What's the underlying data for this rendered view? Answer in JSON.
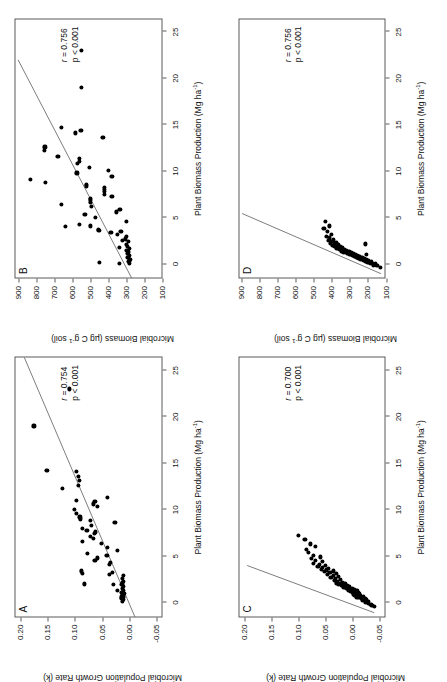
{
  "figure": {
    "panels": [
      {
        "id": "A",
        "letter": "A",
        "stats": {
          "r_label": "r",
          "r_value": "= 0.754",
          "p_value": "p < 0.001"
        },
        "xlabel": "Plant Biomass Production (Mg ha-1)",
        "ylabel": "Microbial Population Growth Rate (k)",
        "xticks": [
          0,
          5,
          10,
          15,
          20,
          25
        ],
        "yticks": [
          "-0.05",
          "0.00",
          "0.05",
          "0.10",
          "0.15",
          "0.20"
        ],
        "xlim": [
          -1.6,
          26.5
        ],
        "ylim": [
          -0.062,
          0.212
        ],
        "fit": {
          "x1": -1.6,
          "y1": -0.012,
          "x2": 26.5,
          "y2": 0.194
        },
        "points": [
          [
            0.1,
            0.012
          ],
          [
            0.3,
            0.01
          ],
          [
            0.4,
            0.014
          ],
          [
            0.5,
            0.011
          ],
          [
            0.6,
            0.013
          ],
          [
            0.7,
            0.01
          ],
          [
            0.9,
            0.012
          ],
          [
            1.0,
            0.009
          ],
          [
            1.1,
            0.013
          ],
          [
            1.3,
            0.011
          ],
          [
            1.5,
            0.012
          ],
          [
            1.7,
            0.01
          ],
          [
            1.9,
            0.013
          ],
          [
            2.1,
            0.012
          ],
          [
            2.3,
            0.011
          ],
          [
            2.6,
            0.012
          ],
          [
            2.9,
            0.01
          ],
          [
            1.3,
            0.022
          ],
          [
            1.9,
            0.029
          ],
          [
            2.0,
            0.082
          ],
          [
            3.0,
            0.036
          ],
          [
            3.1,
            0.086
          ],
          [
            3.2,
            0.03
          ],
          [
            3.4,
            0.088
          ],
          [
            4.1,
            0.036
          ],
          [
            4.3,
            0.035
          ],
          [
            4.5,
            0.063
          ],
          [
            4.8,
            0.058
          ],
          [
            5.1,
            0.041
          ],
          [
            5.3,
            0.077
          ],
          [
            5.6,
            0.021
          ],
          [
            5.9,
            0.04
          ],
          [
            6.4,
            0.051
          ],
          [
            6.6,
            0.086
          ],
          [
            6.9,
            0.066
          ],
          [
            7.1,
            0.072
          ],
          [
            7.4,
            0.064
          ],
          [
            7.6,
            0.062
          ],
          [
            7.8,
            0.078
          ],
          [
            8.0,
            0.087
          ],
          [
            8.3,
            0.069
          ],
          [
            8.6,
            0.026
          ],
          [
            8.8,
            0.072
          ],
          [
            9.0,
            0.09
          ],
          [
            9.2,
            0.091
          ],
          [
            9.6,
            0.097
          ],
          [
            10.0,
            0.101
          ],
          [
            10.3,
            0.058
          ],
          [
            10.6,
            0.066
          ],
          [
            10.9,
            0.063
          ],
          [
            11.0,
            0.097
          ],
          [
            11.3,
            0.04
          ],
          [
            12.3,
            0.124
          ],
          [
            12.6,
            0.094
          ],
          [
            13.1,
            0.092
          ],
          [
            13.6,
            0.093
          ],
          [
            14.1,
            0.097
          ],
          [
            14.2,
            0.152
          ],
          [
            19.0,
            0.176
          ],
          [
            23.0,
            0.11
          ]
        ]
      },
      {
        "id": "B",
        "letter": "B",
        "stats": {
          "r_label": "r",
          "r_value": "= 0.756",
          "p_value": "p < 0.001"
        },
        "xlabel": "Plant Biomass Production (Mg ha-1)",
        "ylabel": "Microbial Biomass (ug C g-1 soil)",
        "xticks": [
          0,
          5,
          10,
          15,
          20,
          25
        ],
        "yticks": [
          100,
          200,
          300,
          400,
          500,
          600,
          700,
          800,
          900
        ],
        "xlim": [
          -1.6,
          26.5
        ],
        "ylim": [
          100,
          920
        ],
        "fit": {
          "x1": -1.6,
          "y1": 268,
          "x2": 22.0,
          "y2": 900
        },
        "points": [
          [
            0.1,
            282
          ],
          [
            0.3,
            286
          ],
          [
            0.5,
            281
          ],
          [
            0.7,
            292
          ],
          [
            0.9,
            284
          ],
          [
            1.1,
            296
          ],
          [
            1.3,
            288
          ],
          [
            1.5,
            300
          ],
          [
            1.7,
            285
          ],
          [
            1.9,
            293
          ],
          [
            2.1,
            300
          ],
          [
            2.4,
            287
          ],
          [
            2.7,
            306
          ],
          [
            0.1,
            340
          ],
          [
            1.8,
            338
          ],
          [
            2.5,
            320
          ],
          [
            0.2,
            448
          ],
          [
            3.0,
            300
          ],
          [
            3.2,
            352
          ],
          [
            3.4,
            386
          ],
          [
            3.5,
            330
          ],
          [
            3.6,
            452
          ],
          [
            3.7,
            456
          ],
          [
            4.0,
            640
          ],
          [
            4.1,
            498
          ],
          [
            4.3,
            560
          ],
          [
            4.6,
            300
          ],
          [
            5.0,
            472
          ],
          [
            5.3,
            530
          ],
          [
            5.6,
            356
          ],
          [
            5.9,
            336
          ],
          [
            6.2,
            492
          ],
          [
            6.4,
            660
          ],
          [
            6.6,
            500
          ],
          [
            6.9,
            498
          ],
          [
            7.1,
            500
          ],
          [
            7.3,
            380
          ],
          [
            7.5,
            420
          ],
          [
            7.8,
            420
          ],
          [
            8.0,
            420
          ],
          [
            8.2,
            420
          ],
          [
            8.4,
            520
          ],
          [
            8.6,
            520
          ],
          [
            8.8,
            750
          ],
          [
            9.1,
            830
          ],
          [
            9.4,
            380
          ],
          [
            9.8,
            574
          ],
          [
            10.1,
            400
          ],
          [
            10.4,
            506
          ],
          [
            10.8,
            572
          ],
          [
            11.0,
            560
          ],
          [
            11.4,
            560
          ],
          [
            11.6,
            680
          ],
          [
            12.2,
            755
          ],
          [
            12.6,
            752
          ],
          [
            13.6,
            430
          ],
          [
            14.1,
            582
          ],
          [
            14.4,
            552
          ],
          [
            14.7,
            660
          ],
          [
            19.0,
            548
          ],
          [
            23.0,
            550
          ]
        ]
      },
      {
        "id": "C",
        "letter": "C",
        "stats": {
          "r_label": "r",
          "r_value": "= 0.700",
          "p_value": "p < 0.001"
        },
        "xlabel": "Plant Biomass Production (Mg ha-1)",
        "ylabel": "Microbial Population Growth Rate (k)",
        "xticks": [
          0,
          5,
          10,
          15,
          20,
          25
        ],
        "yticks": [
          "-0.05",
          "0.00",
          "0.05",
          "0.10",
          "0.15",
          "0.20"
        ],
        "xlim": [
          -1.6,
          26.5
        ],
        "ylim": [
          -0.062,
          0.212
        ],
        "fit": {
          "x1": -1.1,
          "y1": -0.04,
          "x2": 4.0,
          "y2": 0.196
        },
        "points": [
          [
            -0.4,
            -0.041
          ],
          [
            -0.3,
            -0.036
          ],
          [
            -0.2,
            -0.034
          ],
          [
            -0.1,
            -0.03
          ],
          [
            0.0,
            -0.028
          ],
          [
            0.05,
            -0.024
          ],
          [
            0.1,
            -0.03
          ],
          [
            0.15,
            -0.026
          ],
          [
            0.2,
            -0.022
          ],
          [
            0.25,
            -0.018
          ],
          [
            0.3,
            -0.026
          ],
          [
            0.35,
            -0.02
          ],
          [
            0.4,
            -0.016
          ],
          [
            0.45,
            -0.024
          ],
          [
            0.5,
            -0.012
          ],
          [
            0.55,
            -0.018
          ],
          [
            0.6,
            -0.008
          ],
          [
            0.62,
            -0.014
          ],
          [
            0.65,
            -0.02
          ],
          [
            0.7,
            -0.01
          ],
          [
            0.75,
            -0.004
          ],
          [
            0.8,
            -0.014
          ],
          [
            0.85,
            -0.008
          ],
          [
            0.9,
            -0.002
          ],
          [
            0.95,
            -0.012
          ],
          [
            1.0,
            -0.006
          ],
          [
            1.05,
            0.0
          ],
          [
            1.1,
            -0.01
          ],
          [
            1.15,
            -0.004
          ],
          [
            1.2,
            0.004
          ],
          [
            1.25,
            -0.008
          ],
          [
            1.3,
            0.002
          ],
          [
            1.35,
            0.008
          ],
          [
            1.4,
            -0.004
          ],
          [
            1.45,
            0.006
          ],
          [
            1.5,
            0.012
          ],
          [
            1.55,
            0.0
          ],
          [
            1.6,
            0.01
          ],
          [
            1.65,
            0.016
          ],
          [
            1.7,
            0.006
          ],
          [
            1.75,
            0.014
          ],
          [
            1.8,
            0.02
          ],
          [
            1.85,
            0.01
          ],
          [
            1.9,
            0.018
          ],
          [
            1.95,
            0.026
          ],
          [
            2.0,
            0.014
          ],
          [
            2.05,
            0.022
          ],
          [
            2.1,
            0.03
          ],
          [
            2.2,
            0.018
          ],
          [
            2.3,
            0.028
          ],
          [
            2.4,
            0.034
          ],
          [
            2.5,
            0.022
          ],
          [
            2.6,
            0.032
          ],
          [
            2.7,
            0.04
          ],
          [
            2.8,
            0.026
          ],
          [
            2.9,
            0.036
          ],
          [
            3.0,
            0.046
          ],
          [
            3.1,
            0.03
          ],
          [
            3.2,
            0.042
          ],
          [
            3.3,
            0.052
          ],
          [
            3.4,
            0.036
          ],
          [
            3.5,
            0.048
          ],
          [
            3.6,
            0.058
          ],
          [
            3.7,
            0.044
          ],
          [
            3.8,
            0.056
          ],
          [
            3.9,
            0.064
          ],
          [
            4.0,
            0.05
          ],
          [
            4.1,
            0.062
          ],
          [
            4.2,
            0.072
          ],
          [
            4.4,
            0.056
          ],
          [
            4.5,
            0.068
          ],
          [
            4.7,
            0.076
          ],
          [
            4.9,
            0.06
          ],
          [
            5.1,
            0.072
          ],
          [
            5.4,
            0.082
          ],
          [
            5.7,
            0.086
          ],
          [
            6.0,
            0.068
          ],
          [
            6.3,
            0.078
          ],
          [
            6.8,
            0.088
          ],
          [
            7.2,
            0.1
          ]
        ]
      },
      {
        "id": "D",
        "letter": "D",
        "stats": {
          "r_label": "r",
          "r_value": "= 0.756",
          "p_value": "p < 0.001"
        },
        "xlabel": "Plant Biomass Production (Mg ha-1)",
        "ylabel": "Microbial Biomass (ug C g-1 soil)",
        "xticks": [
          0,
          5,
          10,
          15,
          20,
          25
        ],
        "yticks": [
          100,
          200,
          300,
          400,
          500,
          600,
          700,
          800,
          900
        ],
        "xlim": [
          -1.6,
          26.5
        ],
        "ylim": [
          100,
          920
        ],
        "fit": {
          "x1": -1.1,
          "y1": 128,
          "x2": 5.4,
          "y2": 900
        },
        "points": [
          [
            -0.35,
            132
          ],
          [
            -0.2,
            150
          ],
          [
            -0.1,
            168
          ],
          [
            0.0,
            160
          ],
          [
            0.05,
            186
          ],
          [
            0.1,
            176
          ],
          [
            0.15,
            200
          ],
          [
            0.2,
            192
          ],
          [
            0.25,
            214
          ],
          [
            0.3,
            182
          ],
          [
            0.32,
            206
          ],
          [
            0.35,
            226
          ],
          [
            0.4,
            198
          ],
          [
            0.45,
            220
          ],
          [
            0.5,
            240
          ],
          [
            0.52,
            210
          ],
          [
            0.55,
            232
          ],
          [
            0.6,
            252
          ],
          [
            0.62,
            222
          ],
          [
            0.65,
            244
          ],
          [
            0.7,
            264
          ],
          [
            0.72,
            234
          ],
          [
            0.75,
            256
          ],
          [
            0.8,
            276
          ],
          [
            0.82,
            246
          ],
          [
            0.85,
            268
          ],
          [
            0.9,
            288
          ],
          [
            0.92,
            258
          ],
          [
            0.95,
            280
          ],
          [
            1.0,
            300
          ],
          [
            1.02,
            270
          ],
          [
            1.05,
            292
          ],
          [
            1.1,
            312
          ],
          [
            1.12,
            282
          ],
          [
            1.15,
            304
          ],
          [
            1.2,
            324
          ],
          [
            1.22,
            294
          ],
          [
            1.25,
            316
          ],
          [
            1.3,
            336
          ],
          [
            1.32,
            306
          ],
          [
            1.35,
            328
          ],
          [
            1.4,
            348
          ],
          [
            1.45,
            318
          ],
          [
            1.5,
            340
          ],
          [
            1.55,
            360
          ],
          [
            1.6,
            330
          ],
          [
            1.65,
            352
          ],
          [
            1.7,
            372
          ],
          [
            1.75,
            342
          ],
          [
            1.8,
            364
          ],
          [
            1.85,
            384
          ],
          [
            1.9,
            354
          ],
          [
            1.95,
            376
          ],
          [
            2.0,
            396
          ],
          [
            2.05,
            366
          ],
          [
            2.1,
            388
          ],
          [
            2.2,
            408
          ],
          [
            2.3,
            378
          ],
          [
            2.4,
            400
          ],
          [
            2.5,
            420
          ],
          [
            2.6,
            390
          ],
          [
            2.8,
            412
          ],
          [
            3.0,
            432
          ],
          [
            3.2,
            402
          ],
          [
            3.5,
            424
          ],
          [
            3.8,
            444
          ],
          [
            4.1,
            414
          ],
          [
            4.6,
            436
          ],
          [
            1.05,
            210
          ],
          [
            2.15,
            216
          ]
        ]
      }
    ]
  }
}
